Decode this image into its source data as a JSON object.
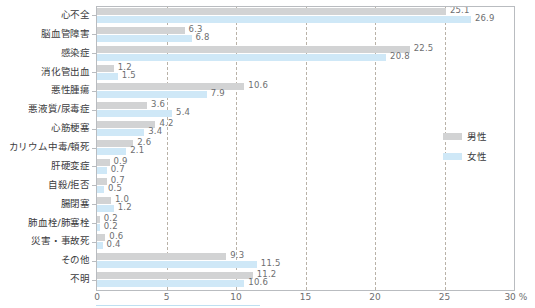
{
  "chart_data": {
    "type": "bar",
    "orientation": "horizontal",
    "title": "",
    "xlabel": "%",
    "ylabel": "",
    "xlim": [
      0,
      30
    ],
    "xticks": [
      "0",
      "5",
      "10",
      "15",
      "20",
      "25",
      "30 %"
    ],
    "xtick_values": [
      0,
      5,
      10,
      15,
      20,
      25,
      30
    ],
    "grid": "vertical-dashed",
    "legend_position": "right-middle",
    "categories": [
      "心不全",
      "脳血管障害",
      "感染症",
      "消化管出血",
      "悪性腫瘍",
      "悪液質/尿毒症",
      "心筋梗塞",
      "カリウム中毒/頓死",
      "肝硬変症",
      "自殺/拒否",
      "腸閉塞",
      "肺血栓/肺塞栓",
      "災害・事故死",
      "その他",
      "不明"
    ],
    "series": [
      {
        "name": "男性",
        "color": "#d2d3d4",
        "values": [
          25.1,
          6.3,
          22.5,
          1.2,
          10.6,
          3.6,
          4.2,
          2.6,
          0.9,
          0.7,
          1.0,
          0.2,
          0.6,
          9.3,
          11.2
        ]
      },
      {
        "name": "女性",
        "color": "#cfe8f7",
        "values": [
          26.9,
          6.8,
          20.8,
          1.5,
          7.9,
          5.4,
          3.4,
          2.1,
          0.7,
          0.5,
          1.2,
          0.2,
          0.4,
          11.5,
          10.6
        ]
      }
    ]
  },
  "legend": {
    "items": [
      {
        "label": "男性",
        "color": "#d2d3d4"
      },
      {
        "label": "女性",
        "color": "#cfe8f7"
      }
    ]
  }
}
